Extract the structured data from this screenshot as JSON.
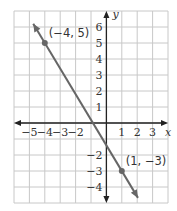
{
  "chart_data": {
    "type": "line",
    "title": "",
    "xlabel": "x",
    "ylabel": "y",
    "xlim": [
      -6,
      4
    ],
    "ylim": [
      -5,
      7
    ],
    "grid": true,
    "x_tick_labels": [
      "−5",
      "−4",
      "−3",
      "−2",
      "1",
      "2",
      "3"
    ],
    "x_ticks": [
      -5,
      -4,
      -3,
      -2,
      1,
      2,
      3
    ],
    "y_tick_labels": [
      "6",
      "5",
      "4",
      "3",
      "2",
      "1",
      "−2",
      "−3",
      "−4"
    ],
    "y_ticks": [
      6,
      5,
      4,
      3,
      2,
      1,
      -2,
      -3,
      -4
    ],
    "series": [
      {
        "name": "line through (−4, 5) and (1, −3)",
        "slope": -1.6,
        "intercept": -1.4,
        "points": [
          {
            "x": -4,
            "y": 5,
            "label": "(−4, 5)"
          },
          {
            "x": 1,
            "y": -3,
            "label": "(1, −3)"
          }
        ],
        "color": "#666666"
      }
    ]
  }
}
